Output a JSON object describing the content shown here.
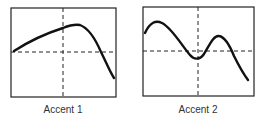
{
  "panels": [
    {
      "label": "Accent 1",
      "description": "single peak right of center, then steep drop"
    },
    {
      "label": "Accent 2",
      "description": "two peaks: early high peak, dip at center, second peak, then drop"
    }
  ],
  "colors": {
    "line": "#111111",
    "frame": "#222222",
    "background": "#ffffff"
  }
}
